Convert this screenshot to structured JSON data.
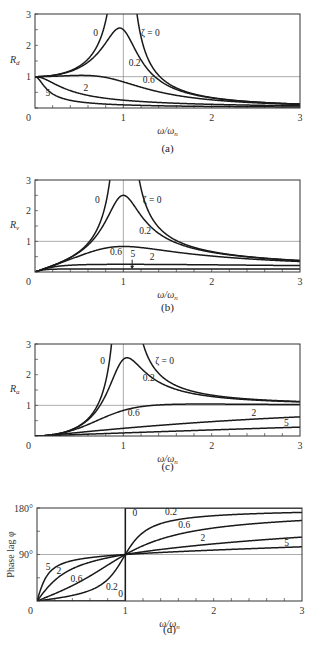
{
  "chart_data": [
    {
      "id": "a",
      "type": "line",
      "caption": "(a)",
      "ylabel": "R_d",
      "ylabel_main": "R",
      "ylabel_sub": "d",
      "xlabel": "ω/ω_n",
      "xlim": [
        0,
        3
      ],
      "ylim": [
        0,
        3
      ],
      "xticks": [
        "0",
        "1",
        "2",
        "3"
      ],
      "yticks": [
        "0",
        "1",
        "2",
        "3"
      ],
      "ref_lines": {
        "x": 1,
        "y": 1
      },
      "legend_title": "ζ",
      "series": [
        {
          "name": "ζ = 0",
          "zeta": 0
        },
        {
          "name": "0.2",
          "zeta": 0.2
        },
        {
          "name": "0.6",
          "zeta": 0.6
        },
        {
          "name": "2",
          "zeta": 2
        },
        {
          "name": "5",
          "zeta": 5
        }
      ],
      "labels": [
        {
          "text": "0",
          "x": 0.66,
          "y": 2.3
        },
        {
          "text": "ζ = 0",
          "x": 1.2,
          "y": 2.3
        },
        {
          "text": "0.2",
          "x": 1.06,
          "y": 1.35
        },
        {
          "text": "0.6",
          "x": 1.22,
          "y": 0.8
        },
        {
          "text": "2",
          "x": 0.55,
          "y": 0.55
        },
        {
          "text": "5",
          "x": 0.12,
          "y": 0.38
        }
      ],
      "sample_values": {
        "x": [
          0,
          0.5,
          1.0,
          1.5,
          2.0,
          3.0
        ],
        "zeta_0.2": [
          1.0,
          1.29,
          2.5,
          0.74,
          0.32,
          0.12
        ],
        "zeta_0.6": [
          1.0,
          1.05,
          0.83,
          0.54,
          0.29,
          0.12
        ],
        "zeta_2": [
          1.0,
          0.49,
          0.25,
          0.16,
          0.12,
          0.08
        ],
        "zeta_5": [
          1.0,
          0.2,
          0.1,
          0.07,
          0.05,
          0.03
        ]
      }
    },
    {
      "id": "b",
      "type": "line",
      "caption": "(b)",
      "ylabel": "R_v",
      "ylabel_main": "R",
      "ylabel_sub": "v",
      "xlabel": "ω/ω_n",
      "xlim": [
        0,
        3
      ],
      "ylim": [
        0,
        3
      ],
      "xticks": [
        "0",
        "1",
        "2",
        "3"
      ],
      "yticks": [
        "0",
        "1",
        "2",
        "3"
      ],
      "ref_lines": {
        "x": 1,
        "y": 1
      },
      "legend_title": "ζ",
      "series": [
        {
          "name": "ζ = 0",
          "zeta": 0
        },
        {
          "name": "0.2",
          "zeta": 0.2
        },
        {
          "name": "0.6",
          "zeta": 0.6
        },
        {
          "name": "2",
          "zeta": 2
        },
        {
          "name": "5",
          "zeta": 5
        }
      ],
      "labels": [
        {
          "text": "0",
          "x": 0.68,
          "y": 2.25
        },
        {
          "text": "ζ = 0",
          "x": 1.22,
          "y": 2.25
        },
        {
          "text": "0.2",
          "x": 1.18,
          "y": 1.25
        },
        {
          "text": "0.6",
          "x": 0.85,
          "y": 0.55
        },
        {
          "text": "5",
          "x": 1.08,
          "y": 0.48
        },
        {
          "text": "2",
          "x": 1.3,
          "y": 0.38
        }
      ],
      "sample_values": {
        "x": [
          0,
          0.5,
          1.0,
          1.5,
          2.0,
          3.0
        ],
        "zeta_0.2": [
          0,
          0.64,
          2.5,
          1.11,
          0.64,
          0.37
        ],
        "zeta_0.6": [
          0,
          0.52,
          0.83,
          0.81,
          0.58,
          0.36
        ],
        "zeta_2": [
          0,
          0.24,
          0.25,
          0.24,
          0.23,
          0.22
        ],
        "zeta_5": [
          0,
          0.1,
          0.1,
          0.1,
          0.1,
          0.1
        ]
      }
    },
    {
      "id": "c",
      "type": "line",
      "caption": "(c)",
      "ylabel": "R_a",
      "ylabel_main": "R",
      "ylabel_sub": "a",
      "xlabel": "ω/ω_n",
      "xlim": [
        0,
        3
      ],
      "ylim": [
        0,
        3
      ],
      "xticks": [
        "0",
        "1",
        "2",
        "3"
      ],
      "yticks": [
        "0",
        "1",
        "2",
        "3"
      ],
      "ref_lines": {
        "x": 1,
        "y": 1
      },
      "legend_title": "ζ",
      "series": [
        {
          "name": "ζ = 0",
          "zeta": 0
        },
        {
          "name": "0.2",
          "zeta": 0.2
        },
        {
          "name": "0.6",
          "zeta": 0.6
        },
        {
          "name": "2",
          "zeta": 2
        },
        {
          "name": "5",
          "zeta": 5
        }
      ],
      "labels": [
        {
          "text": "0",
          "x": 0.74,
          "y": 2.35
        },
        {
          "text": "ζ = 0",
          "x": 1.36,
          "y": 2.35
        },
        {
          "text": "0.2",
          "x": 1.22,
          "y": 1.8
        },
        {
          "text": "0.6",
          "x": 1.05,
          "y": 0.65
        },
        {
          "text": "2",
          "x": 2.45,
          "y": 0.65
        },
        {
          "text": "5",
          "x": 2.82,
          "y": 0.32
        }
      ],
      "sample_values": {
        "x": [
          0,
          0.5,
          1.0,
          1.5,
          2.0,
          3.0
        ],
        "zeta_0.2": [
          0,
          0.32,
          2.5,
          1.66,
          1.28,
          1.12
        ],
        "zeta_0.6": [
          0,
          0.26,
          0.83,
          1.21,
          1.15,
          1.09
        ],
        "zeta_2": [
          0,
          0.12,
          0.25,
          0.37,
          0.47,
          0.62
        ],
        "zeta_5": [
          0,
          0.05,
          0.1,
          0.15,
          0.2,
          0.29
        ]
      }
    },
    {
      "id": "d",
      "type": "line",
      "caption": "(d)",
      "ylabel": "Phase lag φ",
      "xlabel": "ω/ω_n",
      "xlim": [
        0,
        3
      ],
      "ylim": [
        0,
        180
      ],
      "xticks": [
        "0",
        "1",
        "2",
        "3"
      ],
      "yticks": [
        "0",
        "90°",
        "180°"
      ],
      "ref_lines": {
        "x": 1,
        "y": 90
      },
      "legend_title": "ζ",
      "series": [
        {
          "name": "0",
          "zeta": 0
        },
        {
          "name": "0.2",
          "zeta": 0.2
        },
        {
          "name": "0.6",
          "zeta": 0.6
        },
        {
          "name": "2",
          "zeta": 2
        },
        {
          "name": "5",
          "zeta": 5
        }
      ],
      "labels": [
        {
          "text": "0",
          "x": 1.08,
          "y": 165
        },
        {
          "text": "0.2",
          "x": 1.45,
          "y": 166
        },
        {
          "text": "0.6",
          "x": 1.6,
          "y": 142
        },
        {
          "text": "2",
          "x": 1.85,
          "y": 116
        },
        {
          "text": "5",
          "x": 2.8,
          "y": 107
        },
        {
          "text": "5",
          "x": 0.1,
          "y": 60
        },
        {
          "text": "2",
          "x": 0.22,
          "y": 53
        },
        {
          "text": "0.6",
          "x": 0.38,
          "y": 37
        },
        {
          "text": "0.2",
          "x": 0.78,
          "y": 22
        },
        {
          "text": "0",
          "x": 0.92,
          "y": 8
        }
      ],
      "sample_values": {
        "x": [
          0,
          0.5,
          1.0,
          1.5,
          2.0,
          3.0
        ],
        "zeta_0.2": [
          0,
          14.9,
          90,
          166.5,
          165.1,
          171.5
        ],
        "zeta_0.6": [
          0,
          38.7,
          90,
          144.2,
          141.3,
          155.8
        ],
        "zeta_2": [
          0,
          69.4,
          90,
          112.6,
          110.6,
          123.7
        ],
        "zeta_5": [
          0,
          81.5,
          90,
          99.5,
          98.5,
          103.6
        ]
      }
    }
  ]
}
